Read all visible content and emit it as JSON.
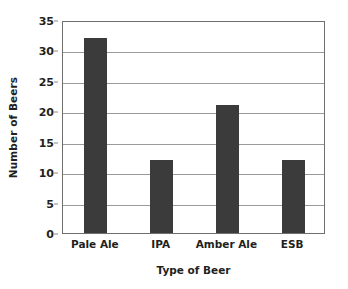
{
  "chart_data": {
    "type": "bar",
    "title": "",
    "subtitle": "",
    "xlabel": "Type of Beer",
    "ylabel": "Number of Beers",
    "categories": [
      "Pale Ale",
      "IPA",
      "Amber Ale",
      "ESB"
    ],
    "values": [
      32,
      12,
      21,
      12
    ],
    "ylim": [
      0,
      35
    ],
    "yticks": [
      0,
      5,
      10,
      15,
      20,
      25,
      30,
      35
    ],
    "ytick_labels": [
      "0",
      "5",
      "10",
      "15",
      "20",
      "25",
      "30",
      "35"
    ],
    "grid": "horizontal",
    "legend": "none",
    "bar_color": "#3b3b3b",
    "axis_color": "#6f6f6f",
    "grid_color": "#9a9a9a",
    "background_color": "#ffffff",
    "text_color": "#231f20"
  }
}
